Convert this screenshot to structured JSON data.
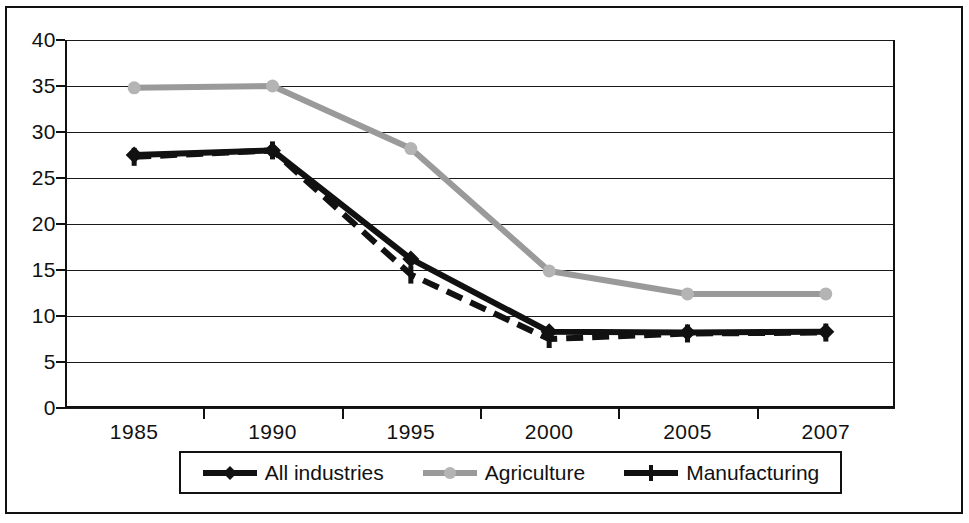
{
  "chart_data": {
    "type": "line",
    "title": "",
    "subtitle": "",
    "xlabel": "",
    "ylabel": "",
    "categories": [
      "1985",
      "1990",
      "1995",
      "2000",
      "2005",
      "2007"
    ],
    "ylim": [
      0,
      40
    ],
    "yticks": [
      0,
      5,
      10,
      15,
      20,
      25,
      30,
      35,
      40
    ],
    "ytick_labels": [
      "0",
      "5",
      "10",
      "15",
      "20",
      "25",
      "30",
      "35",
      "40"
    ],
    "grid": true,
    "grid_axis": "y",
    "legend_position": "bottom",
    "series": [
      {
        "name": "All industries",
        "values": [
          27.5,
          28.0,
          16.2,
          8.3,
          8.2,
          8.3
        ],
        "color": "#111111",
        "marker": "diamond",
        "line_style": "solid"
      },
      {
        "name": "Agriculture",
        "values": [
          34.8,
          35.0,
          28.2,
          14.9,
          12.4,
          12.4
        ],
        "color": "#9a9a9a",
        "marker": "circle",
        "line_style": "solid"
      },
      {
        "name": "Manufacturing",
        "values": [
          27.3,
          28.0,
          14.5,
          7.5,
          8.1,
          8.2
        ],
        "color": "#111111",
        "marker": "plus",
        "line_style": "dashed"
      }
    ]
  },
  "legend": {
    "items": [
      {
        "label": "All industries"
      },
      {
        "label": "Agriculture"
      },
      {
        "label": "Manufacturing"
      }
    ]
  }
}
